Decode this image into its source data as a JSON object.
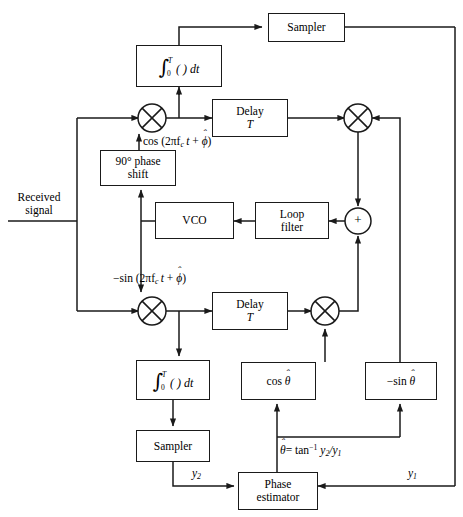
{
  "diagram": {
    "stroke_color": "#1a1a1a",
    "background": "#ffffff"
  },
  "labels": {
    "received_signal_line1": "Received",
    "received_signal_line2": "signal",
    "cos_drive": "cos (2πf",
    "neg_sin_drive": "−sin (2πf",
    "y2": "y",
    "y1": "y",
    "theta_estimate": "= tan"
  },
  "blocks": {
    "integrator_top": {
      "name": "integrator-top",
      "text": "∫0T ( ) dt"
    },
    "sampler_top": {
      "name": "sampler-top",
      "text": "Sampler"
    },
    "delay_top_line1": "Delay",
    "delay_top_line2": "T",
    "phase_shift_line1": "90° phase",
    "phase_shift_line2": "shift",
    "vco": "VCO",
    "loop_filter_line1": "Loop",
    "loop_filter_line2": "filter",
    "summer": "+",
    "delay_bottom_line1": "Delay",
    "delay_bottom_line2": "T",
    "integrator_bottom": {
      "name": "integrator-bottom",
      "text": "∫0T ( ) dt"
    },
    "sampler_bottom": "Sampler",
    "cos_theta": "cos",
    "neg_sin_theta": "−sin",
    "phase_estimator_line1": "Phase",
    "phase_estimator_line2": "estimator"
  },
  "symbols": {
    "theta": "θ",
    "phi": "ϕ",
    "hat": "ˆ",
    "pi": "π",
    "integral": "∫",
    "minus": "−",
    "subscript_c": "c",
    "upper_limit": "T",
    "lower_limit": "0",
    "dt": "dt",
    "t": "t",
    "plus": "+",
    "inverse_exponent": "−1",
    "mixer_glyph": "multiplier-cross-circle",
    "adder_glyph": "summing-junction-plus"
  }
}
